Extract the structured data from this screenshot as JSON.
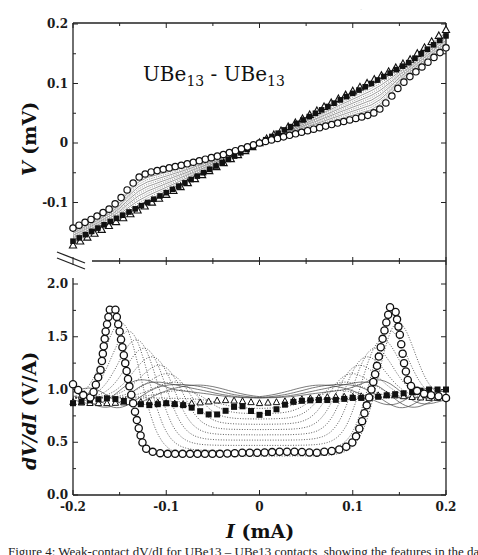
{
  "figure": {
    "panel_title": "UBe",
    "panel_title_sub": "13",
    "panel_title_sep": " - ",
    "panel_title2": "UBe",
    "panel_title2_sub": "13",
    "caption_clipped": "Figure 4: Weak-contact dV/dI for UBe13 – UBe13 contacts, showing the features in the data"
  },
  "chart_data": [
    {
      "type": "line",
      "panel": "top",
      "title": "UBe13 - UBe13",
      "xlabel": "I (mA)",
      "ylabel": "V (mV)",
      "xlim": [
        -0.2,
        0.2
      ],
      "ylim": [
        -0.165,
        0.2
      ],
      "xticks": [
        -0.2,
        -0.1,
        0,
        0.1,
        0.2
      ],
      "yticks": [
        0.2,
        0.1,
        0,
        -0.1
      ],
      "ytick_labels": [
        "0.2",
        "0.1",
        "0",
        "-0.1"
      ],
      "grid": false,
      "series": [
        {
          "name": "circles (open)",
          "marker": "circle-open",
          "x": [
            -0.2,
            -0.18,
            -0.16,
            -0.15,
            -0.14,
            -0.13,
            -0.12,
            -0.1,
            -0.08,
            -0.06,
            -0.04,
            -0.02,
            0,
            0.02,
            0.04,
            0.06,
            0.08,
            0.1,
            0.12,
            0.13,
            0.14,
            0.15,
            0.16,
            0.18,
            0.2
          ],
          "y": [
            -0.143,
            -0.128,
            -0.11,
            -0.095,
            -0.075,
            -0.058,
            -0.05,
            -0.043,
            -0.036,
            -0.028,
            -0.02,
            -0.01,
            0,
            0.008,
            0.016,
            0.024,
            0.032,
            0.04,
            0.048,
            0.058,
            0.075,
            0.095,
            0.11,
            0.135,
            0.16
          ]
        },
        {
          "name": "triangles (open)",
          "marker": "triangle-open",
          "x": [
            -0.2,
            -0.16,
            -0.12,
            -0.08,
            -0.04,
            0,
            0.04,
            0.08,
            0.12,
            0.16,
            0.2
          ],
          "y": [
            -0.172,
            -0.138,
            -0.104,
            -0.07,
            -0.035,
            0,
            0.035,
            0.07,
            0.104,
            0.138,
            0.19
          ]
        },
        {
          "name": "squares (filled)",
          "marker": "square-filled",
          "x": [
            -0.2,
            -0.16,
            -0.12,
            -0.08,
            -0.04,
            0,
            0.04,
            0.08,
            0.12,
            0.16,
            0.2
          ],
          "y": [
            -0.165,
            -0.132,
            -0.1,
            -0.067,
            -0.033,
            0,
            0.033,
            0.067,
            0.1,
            0.135,
            0.18
          ]
        }
      ],
      "note": "Family of dotted intermediate curves fills region between circles and triangles"
    },
    {
      "type": "line",
      "panel": "bottom",
      "xlabel": "I (mA)",
      "ylabel": "dV/dI (V/A)",
      "xlim": [
        -0.2,
        0.2
      ],
      "ylim": [
        0.0,
        2.1
      ],
      "xticks": [
        -0.2,
        -0.1,
        0,
        0.1,
        0.2
      ],
      "xtick_labels": [
        "-0.2",
        "-0.1",
        "0",
        "0.1",
        "0.2"
      ],
      "yticks": [
        2.0,
        1.5,
        1.0,
        0.5,
        0.0
      ],
      "ytick_labels": [
        "2.0",
        "1.5",
        "1.0",
        "0.5",
        "0.0"
      ],
      "grid": false,
      "series": [
        {
          "name": "circles (open)",
          "marker": "circle-open",
          "x": [
            -0.2,
            -0.19,
            -0.18,
            -0.17,
            -0.165,
            -0.16,
            -0.155,
            -0.15,
            -0.145,
            -0.14,
            -0.135,
            -0.13,
            -0.125,
            -0.12,
            -0.11,
            -0.1,
            -0.08,
            -0.06,
            -0.04,
            -0.02,
            0,
            0.02,
            0.04,
            0.06,
            0.08,
            0.09,
            0.1,
            0.105,
            0.11,
            0.115,
            0.12,
            0.125,
            0.13,
            0.135,
            0.14,
            0.145,
            0.15,
            0.155,
            0.16,
            0.17,
            0.18,
            0.19,
            0.2
          ],
          "y": [
            1.05,
            0.95,
            0.92,
            1.2,
            1.55,
            1.78,
            1.78,
            1.55,
            1.3,
            1.05,
            0.85,
            0.65,
            0.48,
            0.42,
            0.4,
            0.39,
            0.39,
            0.39,
            0.39,
            0.4,
            0.4,
            0.41,
            0.41,
            0.4,
            0.42,
            0.44,
            0.5,
            0.58,
            0.7,
            0.85,
            1.0,
            1.18,
            1.4,
            1.6,
            1.78,
            1.78,
            1.55,
            1.25,
            1.05,
            0.98,
            0.95,
            0.94,
            0.92
          ]
        },
        {
          "name": "triangles (open)",
          "marker": "triangle-open",
          "x": [
            -0.2,
            -0.18,
            -0.16,
            -0.14,
            -0.12,
            -0.1,
            -0.08,
            -0.06,
            -0.04,
            -0.02,
            0,
            0.02,
            0.04,
            0.06,
            0.08,
            0.1,
            0.12,
            0.14,
            0.16,
            0.18,
            0.2
          ],
          "y": [
            0.88,
            0.87,
            0.87,
            0.88,
            0.88,
            0.87,
            0.86,
            0.88,
            0.9,
            0.89,
            0.87,
            0.88,
            0.9,
            0.92,
            0.93,
            0.93,
            0.94,
            0.95,
            0.93,
            0.92,
            0.92
          ]
        },
        {
          "name": "squares (filled)",
          "marker": "square-filled",
          "x": [
            -0.2,
            -0.18,
            -0.16,
            -0.14,
            -0.12,
            -0.1,
            -0.08,
            -0.07,
            -0.06,
            -0.05,
            -0.04,
            -0.03,
            -0.02,
            -0.01,
            0,
            0.01,
            0.02,
            0.03,
            0.04,
            0.06,
            0.08,
            0.1,
            0.12,
            0.14,
            0.16,
            0.18,
            0.2
          ],
          "y": [
            0.87,
            0.9,
            0.92,
            0.88,
            0.85,
            0.87,
            0.85,
            0.82,
            0.78,
            0.75,
            0.78,
            0.83,
            0.85,
            0.8,
            0.76,
            0.78,
            0.82,
            0.87,
            0.89,
            0.9,
            0.9,
            0.92,
            0.92,
            0.95,
            0.97,
            1.0,
            1.0
          ]
        }
      ],
      "note": "Dotted intermediate curves: peaks shift from |I|~0.155 toward 0 as amplitude decreases; thin solid curves near 1.0"
    }
  ]
}
